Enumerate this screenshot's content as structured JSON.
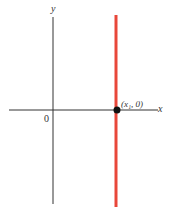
{
  "diagram": {
    "y_axis_label": "y",
    "x_axis_label": "x",
    "origin_label": "0",
    "point_label": "(x₁, 0)",
    "colors": {
      "axes": "#333333",
      "vertical_line": "#e8473a",
      "point": "#111111"
    }
  }
}
